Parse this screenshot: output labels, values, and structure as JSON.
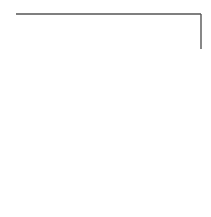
{
  "diagram": {
    "type": "line-drawing",
    "stroke_color": "#555555",
    "background_color": "#ffffff",
    "stroke_width": 1.4,
    "top_edge": {
      "x1": 16,
      "y1": 14,
      "x2": 201,
      "y2": 14
    },
    "right_edge": {
      "x1": 201,
      "y1": 14,
      "x2": 201,
      "y2": 49
    },
    "curve_path": "M201,49 C192,66 180,80 160,87 C145,92 120,90 100,97 C70,108 45,150 17,208"
  }
}
